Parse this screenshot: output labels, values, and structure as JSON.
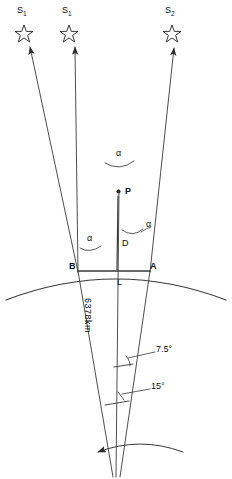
{
  "figure": {
    "type": "geometry-diagram",
    "stars": [
      {
        "id": "star-left",
        "label": "S",
        "subscript": "1",
        "x": 27,
        "y": 18
      },
      {
        "id": "star-middle",
        "label": "S",
        "subscript": "1",
        "x": 72,
        "y": 18
      },
      {
        "id": "star-right",
        "label": "S",
        "subscript": "2",
        "x": 172,
        "y": 18
      }
    ],
    "points": [
      {
        "id": "point-p",
        "label": "P",
        "x": 124,
        "y": 193
      },
      {
        "id": "point-b",
        "label": "B",
        "x": 78,
        "y": 272
      },
      {
        "id": "point-a",
        "label": "A",
        "x": 150,
        "y": 272
      }
    ],
    "segments": [
      {
        "id": "segment-d",
        "label": "D"
      },
      {
        "id": "segment-l",
        "label": "L"
      }
    ],
    "angles": [
      {
        "id": "angle-alpha-top",
        "label": "α"
      },
      {
        "id": "angle-alpha-left",
        "label": "α"
      },
      {
        "id": "angle-alpha-right",
        "label": "α"
      },
      {
        "id": "angle-upper-center",
        "label": "7.5°"
      },
      {
        "id": "angle-lower-center",
        "label": "15°"
      }
    ],
    "earth": {
      "radius_label": "6378km",
      "arc_name": "earth-surface-arc",
      "rotation_arrow": "rotation-arrow"
    },
    "colors": {
      "line": "#3a3a3a",
      "text": "#111111",
      "background": "#ffffff"
    }
  }
}
